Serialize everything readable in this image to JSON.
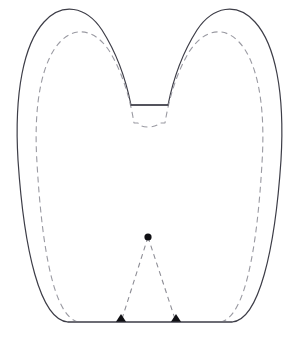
{
  "figure": {
    "canvas": {
      "width": 297,
      "height": 338,
      "background": "#ffffff"
    },
    "styles": {
      "solid_outline_color": "#3d3d47",
      "solid_outline_width": 1.2,
      "dashed_outline_color": "#9a9aa2",
      "dashed_outline_width": 1.1,
      "dashed_outline_pattern": "6 4",
      "dashed_triangle_color": "#8d8d95",
      "dashed_triangle_width": 1.1,
      "dashed_triangle_pattern": "5 4",
      "marker_color": "#101014"
    },
    "geometry": {
      "outer_path": "M 68 322 L 68 322 C 40 320 24 250 18 160 C 14 92 24 44 44 22 C 62 2 86 6 102 30 C 116 52 126 80 131 105 L 168 105 C 173 80 183 52 197 30 C 213 6 237 2 255 22 C 275 44 285 92 281 160 C 275 250 259 320 232 322 Z",
      "inner_dashed_path": "M 78 322 C 54 316 42 250 37 163 C 33 101 43 60 60 42 C 76 25 96 30 110 52 C 122 72 130 98 134 123 L 138 123 C 140 126 143 127 148 127 C 153 127 157 126 160 123 L 165 123 C 169 98 177 72 189 52 C 203 30 223 25 239 42 C 256 60 266 101 262 163 C 257 250 245 316 221 322",
      "triangle_apex": {
        "x": 148,
        "y": 237
      },
      "triangle_base_left": {
        "x": 121,
        "y": 322
      },
      "triangle_base_right": {
        "x": 176,
        "y": 322
      },
      "baseline_y": 322,
      "baseline_x_start": 68,
      "baseline_x_end": 232,
      "notch_bottom_y": 105,
      "notch_left_x": 131,
      "notch_right_x": 168,
      "left_lobe_peak": {
        "x": 68,
        "y": 13
      },
      "right_lobe_peak": {
        "x": 228,
        "y": 13
      }
    },
    "annotations": {
      "apex_marker": "round-dot-marker",
      "base_left_marker": "triangle-marker",
      "base_right_marker": "triangle-marker"
    },
    "labels": []
  }
}
